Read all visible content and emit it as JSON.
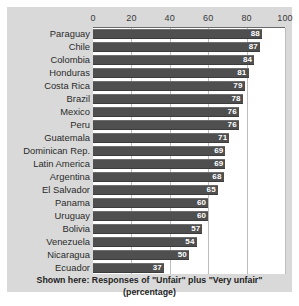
{
  "chart_data": {
    "type": "bar",
    "orientation": "horizontal",
    "title": "",
    "subtitle": "",
    "xlabel": "",
    "ylabel": "",
    "xlim": [
      0,
      100
    ],
    "xticks": [
      0,
      20,
      40,
      60,
      80,
      100
    ],
    "grid": true,
    "legend": "none",
    "categories": [
      "Paraguay",
      "Chile",
      "Colombia",
      "Honduras",
      "Costa Rica",
      "Brazil",
      "Mexico",
      "Peru",
      "Guatemala",
      "Dominican Rep.",
      "Latin America",
      "Argentina",
      "El Salvador",
      "Panama",
      "Uruguay",
      "Bolivia",
      "Venezuela",
      "Nicaragua",
      "Ecuador"
    ],
    "values": [
      88,
      87,
      84,
      81,
      79,
      78,
      76,
      76,
      71,
      69,
      69,
      68,
      65,
      60,
      60,
      57,
      54,
      50,
      37
    ],
    "annotations": {
      "caption": "Shown here: Responses of \"Unfair\" plus \"Very unfair\" (percentage)"
    },
    "colors": {
      "bar": "#4f4f4f",
      "plot_background": "#ffffff",
      "card_background": "#d9d9d9",
      "gridline": "#bdbdbd",
      "value_label": "#ffffff",
      "text": "#2b2b2b"
    }
  },
  "caption": {
    "text": "Shown here: Responses of \"Unfair\" plus \"Very unfair\" (percentage)"
  }
}
